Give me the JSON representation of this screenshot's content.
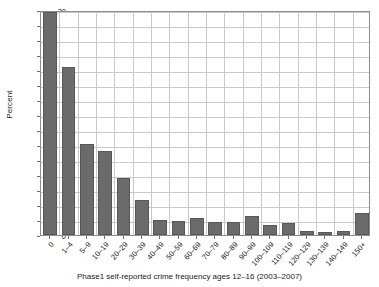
{
  "chart_data": {
    "type": "bar",
    "title": "",
    "xlabel": "Phase1 self-reported crime frequency ages 12–16 (2003–2007)",
    "ylabel": "Percent",
    "ylim": [
      0,
      30
    ],
    "ytick_step": 2,
    "yticks": [
      0,
      2,
      4,
      6,
      8,
      10,
      12,
      14,
      16,
      18,
      20,
      22,
      24,
      26,
      28,
      30
    ],
    "grid": true,
    "legend": null,
    "bar_color": "#6b6b6b",
    "bar_edge_color": "#585858",
    "grid_color": "#c9c9c9",
    "axis_color": "#8c8c8c",
    "categories": [
      "0",
      "1–4",
      "5–9",
      "10–19",
      "20–29",
      "30–39",
      "40–49",
      "50–59",
      "60–69",
      "70–79",
      "80–89",
      "90–99",
      "100–109",
      "110–119",
      "120–129",
      "130–139",
      "140–149",
      "150+"
    ],
    "values": [
      29.8,
      22.4,
      12.2,
      11.2,
      7.6,
      4.7,
      2.0,
      1.9,
      2.3,
      1.8,
      1.8,
      2.6,
      1.4,
      1.6,
      0.6,
      0.4,
      0.6,
      3.0
    ]
  },
  "axes": {
    "y_title": "Percent",
    "x_title": "Phase1 self-reported crime frequency ages 12–16 (2003–2007)"
  }
}
